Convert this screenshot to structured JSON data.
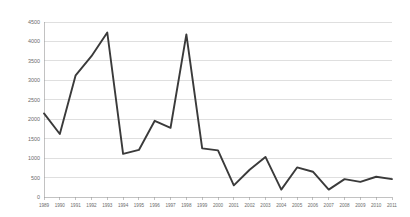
{
  "chart_data": {
    "type": "line",
    "title": "",
    "subtitle": "",
    "xlabel": "",
    "ylabel": "",
    "grid": "horizontal",
    "legend": "none",
    "ylim": [
      0,
      4500
    ],
    "ytick_step": 500,
    "ytick_labels": [
      "0",
      "500",
      "1000",
      "1500",
      "2000",
      "2500",
      "3000",
      "3500",
      "4000",
      "4500"
    ],
    "ytick_values": [
      0,
      500,
      1000,
      1500,
      2000,
      2500,
      3000,
      3500,
      4000,
      4500
    ],
    "categories": [
      "1989",
      "1990",
      "1991",
      "1992",
      "1993",
      "1994",
      "1995",
      "1996",
      "1997",
      "1998",
      "1999",
      "2000",
      "2001",
      "2002",
      "2003",
      "2004",
      "2005",
      "2006",
      "2007",
      "2008",
      "2009",
      "2010",
      "2011"
    ],
    "values": [
      2150,
      1620,
      3130,
      3620,
      4230,
      1110,
      1210,
      1960,
      1780,
      4180,
      1250,
      1200,
      300,
      700,
      1030,
      190,
      760,
      650,
      190,
      460,
      390,
      520,
      460
    ],
    "series": [
      {
        "name": "series-1",
        "color": "#3a3a3a",
        "values": [
          2150,
          1620,
          3130,
          3620,
          4230,
          1110,
          1210,
          1960,
          1780,
          4180,
          1250,
          1200,
          300,
          700,
          1030,
          190,
          760,
          650,
          190,
          460,
          390,
          520,
          460
        ]
      }
    ]
  },
  "plot": {
    "left": 44,
    "right": 392,
    "top": 22,
    "bottom": 197,
    "gridline_color": "#bfbfbf",
    "axis_color": "#9a9a9a",
    "background": "#ffffff"
  }
}
